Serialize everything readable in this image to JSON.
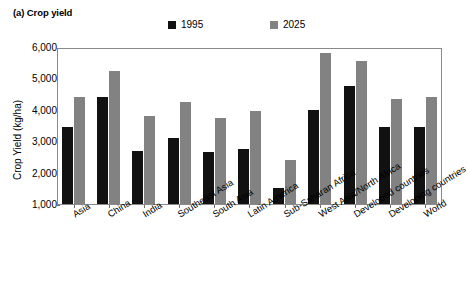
{
  "chart_data": {
    "type": "bar",
    "title": "(a) Crop yield",
    "xlabel": "",
    "ylabel": "Crop Yield (kg/ha)",
    "ylim": [
      1000,
      6000
    ],
    "yticks": [
      1000,
      2000,
      3000,
      4000,
      5000,
      6000
    ],
    "ytick_labels": [
      "1,000",
      "2,000",
      "3,000",
      "4,000",
      "5,000",
      "6,000"
    ],
    "grid": false,
    "legend_position": "top-center",
    "categories": [
      "Asia",
      "China",
      "India",
      "Southeast Asia",
      "South Asia",
      "Latin America",
      "Sub-Saharan Africa",
      "West Asia/North Africa",
      "Developed countries",
      "Developing countries",
      "World"
    ],
    "series": [
      {
        "name": "1995",
        "color": "#111111",
        "values": [
          3450,
          4400,
          2700,
          3100,
          2650,
          2750,
          1500,
          4000,
          4750,
          3450,
          3450
        ]
      },
      {
        "name": "2025",
        "color": "#828282",
        "values": [
          4400,
          5250,
          3800,
          4250,
          3750,
          3950,
          2400,
          5800,
          5550,
          4350,
          4400
        ]
      }
    ]
  }
}
